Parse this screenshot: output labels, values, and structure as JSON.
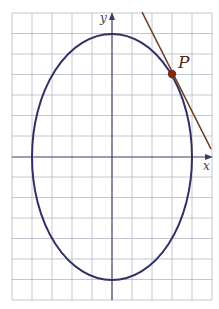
{
  "diagram": {
    "type": "ellipse-with-tangent",
    "axes": {
      "x_label": "x",
      "y_label": "y"
    },
    "point": {
      "label": "P"
    },
    "colors": {
      "background": "#ffffff",
      "grid": "#a9adbd",
      "axes": "#3a3d5c",
      "ellipse": "#2f3163",
      "tangent": "#6b3b1e",
      "point": "#7a2c12",
      "label": "#5a2a14"
    },
    "grid": {
      "cols": 10,
      "rows": 14,
      "cell_w": 20,
      "cell_h": 20.5
    },
    "ellipse": {
      "semi_major_vertical": 6,
      "semi_minor_horizontal": 4,
      "units": "grid cells"
    }
  }
}
